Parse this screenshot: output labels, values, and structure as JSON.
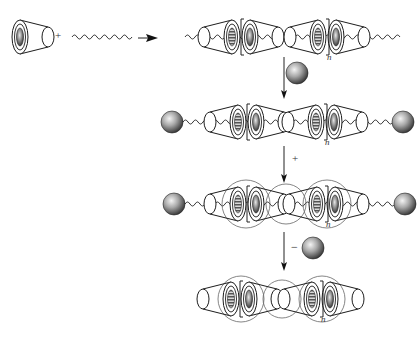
{
  "diagram": {
    "type": "reaction-scheme",
    "components": {
      "ring": "cyclodextrin-cone",
      "axle": "polymer-chain-wavy",
      "stopper": "sphere",
      "crosslink": "figure-eight-rings"
    },
    "steps": [
      {
        "id": "step-1",
        "reactants": [
          "ring",
          "axle"
        ],
        "operator": "+",
        "direction": "right",
        "product": "inclusion-complex"
      },
      {
        "id": "step-2",
        "reagent": "stopper",
        "direction": "down",
        "product": "capped-polyrotaxane"
      },
      {
        "id": "step-3",
        "reagent_label": "+",
        "direction": "down",
        "product": "crosslinked-polyrotaxane"
      },
      {
        "id": "step-4",
        "reagent_label": "−",
        "reagent": "stopper",
        "direction": "down",
        "product": "crosslinked-ring-assembly"
      }
    ]
  },
  "labels": {
    "plus_reactants": "+",
    "plus_step3": "+",
    "minus_step4": "−",
    "repeat_n_row1": "n",
    "repeat_n_row2": "n",
    "repeat_n_row3": "n",
    "repeat_n_row4": "n"
  },
  "colors": {
    "line": "#2a2a2a",
    "ring_outline": "#1e1e1e",
    "crosslink": "#555555",
    "sphere_light": "#f2f2f2",
    "sphere_dark": "#3a3a3a",
    "background": "#ffffff"
  }
}
